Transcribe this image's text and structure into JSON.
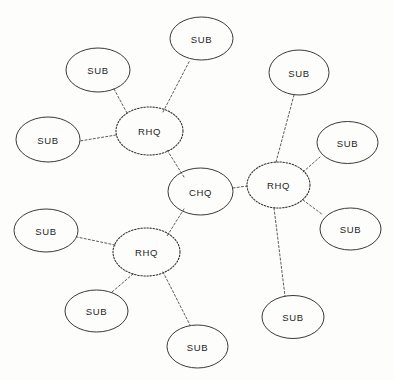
{
  "diagram": {
    "type": "hub-and-spoke network diagram",
    "background_color": "#fdfdfc",
    "node_stroke_color": "#2e2e2e",
    "edge_stroke_color": "#4a4a4a",
    "label_color": "#1d1d1d",
    "node_styles": {
      "chq": "solid",
      "rhq": "dotted",
      "sub": "solid"
    },
    "edge_style": "dotted",
    "nodes": [
      {
        "id": "chq",
        "label": "CHQ",
        "role": "chq",
        "border": "solid",
        "cx": 200.5,
        "cy": 191.5,
        "rx": 32.5,
        "ry": 23.5
      },
      {
        "id": "rhq_tl",
        "label": "RHQ",
        "role": "rhq",
        "border": "dotted",
        "cx": 149.5,
        "cy": 131.0,
        "rx": 33.5,
        "ry": 24.0
      },
      {
        "id": "rhq_r",
        "label": "RHQ",
        "role": "rhq",
        "border": "dotted",
        "cx": 278.5,
        "cy": 185.0,
        "rx": 31.5,
        "ry": 23.0
      },
      {
        "id": "rhq_bl",
        "label": "RHQ",
        "role": "rhq",
        "border": "dotted",
        "cx": 146.5,
        "cy": 252.0,
        "rx": 33.5,
        "ry": 24.0
      },
      {
        "id": "sub_top",
        "label": "SUB",
        "role": "sub",
        "border": "solid",
        "cx": 201.5,
        "cy": 38.5,
        "rx": 31.5,
        "ry": 21.5
      },
      {
        "id": "sub_tl",
        "label": "SUB",
        "role": "sub",
        "border": "solid",
        "cx": 98.0,
        "cy": 70.0,
        "rx": 32.0,
        "ry": 22.0
      },
      {
        "id": "sub_l",
        "label": "SUB",
        "role": "sub",
        "border": "solid",
        "cx": 48.0,
        "cy": 139.5,
        "rx": 32.0,
        "ry": 22.5
      },
      {
        "id": "sub_tr",
        "label": "SUB",
        "role": "sub",
        "border": "solid",
        "cx": 299.0,
        "cy": 72.5,
        "rx": 30.0,
        "ry": 22.5
      },
      {
        "id": "sub_r1",
        "label": "SUB",
        "role": "sub",
        "border": "solid",
        "cx": 347.5,
        "cy": 142.5,
        "rx": 30.5,
        "ry": 21.0
      },
      {
        "id": "sub_r2",
        "label": "SUB",
        "role": "sub",
        "border": "solid",
        "cx": 350.5,
        "cy": 229.0,
        "rx": 30.5,
        "ry": 21.0
      },
      {
        "id": "sub_br",
        "label": "SUB",
        "role": "sub",
        "border": "solid",
        "cx": 293.0,
        "cy": 317.0,
        "rx": 31.0,
        "ry": 21.5
      },
      {
        "id": "sub_bl_l",
        "label": "SUB",
        "role": "sub",
        "border": "solid",
        "cx": 46.0,
        "cy": 230.5,
        "rx": 32.0,
        "ry": 21.5
      },
      {
        "id": "sub_b1",
        "label": "SUB",
        "role": "sub",
        "border": "solid",
        "cx": 96.5,
        "cy": 311.0,
        "rx": 31.5,
        "ry": 21.0
      },
      {
        "id": "sub_b2",
        "label": "SUB",
        "role": "sub",
        "border": "solid",
        "cx": 197.5,
        "cy": 346.5,
        "rx": 30.5,
        "ry": 21.5
      }
    ],
    "edges": [
      {
        "from": "chq",
        "to": "rhq_tl",
        "x1": 184.0,
        "y1": 177.0,
        "x2": 167.0,
        "y2": 150.0
      },
      {
        "from": "chq",
        "to": "rhq_r",
        "x1": 233.0,
        "y1": 188.0,
        "x2": 247.0,
        "y2": 186.0
      },
      {
        "from": "chq",
        "to": "rhq_bl",
        "x1": 184.0,
        "y1": 209.0,
        "x2": 167.0,
        "y2": 236.0
      },
      {
        "from": "rhq_tl",
        "to": "sub_top",
        "x1": 163.0,
        "y1": 112.0,
        "x2": 190.0,
        "y2": 60.0
      },
      {
        "from": "rhq_tl",
        "to": "sub_tl",
        "x1": 127.0,
        "y1": 113.0,
        "x2": 114.0,
        "y2": 89.0
      },
      {
        "from": "rhq_tl",
        "to": "sub_l",
        "x1": 116.0,
        "y1": 135.0,
        "x2": 80.0,
        "y2": 141.0
      },
      {
        "from": "rhq_r",
        "to": "sub_tr",
        "x1": 276.0,
        "y1": 162.0,
        "x2": 294.0,
        "y2": 95.0
      },
      {
        "from": "rhq_r",
        "to": "sub_r1",
        "x1": 303.0,
        "y1": 172.0,
        "x2": 320.0,
        "y2": 157.0
      },
      {
        "from": "rhq_r",
        "to": "sub_r2",
        "x1": 303.0,
        "y1": 200.0,
        "x2": 323.0,
        "y2": 215.0
      },
      {
        "from": "rhq_r",
        "to": "sub_br",
        "x1": 274.0,
        "y1": 208.0,
        "x2": 285.0,
        "y2": 296.0
      },
      {
        "from": "rhq_bl",
        "to": "sub_bl_l",
        "x1": 115.0,
        "y1": 245.0,
        "x2": 77.0,
        "y2": 237.0
      },
      {
        "from": "rhq_bl",
        "to": "sub_b1",
        "x1": 133.0,
        "y1": 274.0,
        "x2": 112.0,
        "y2": 292.0
      },
      {
        "from": "rhq_bl",
        "to": "sub_b2",
        "x1": 163.0,
        "y1": 272.0,
        "x2": 190.0,
        "y2": 325.0
      }
    ]
  }
}
